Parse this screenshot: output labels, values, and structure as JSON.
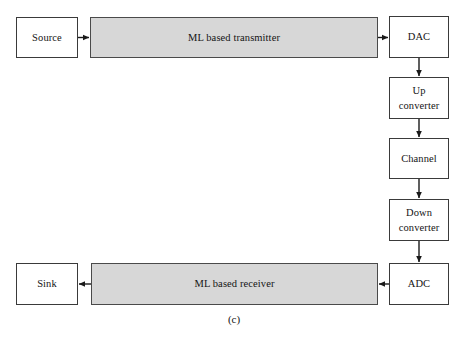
{
  "figure": {
    "caption": "(c)",
    "colors": {
      "shaded_block_fill": "#d7d7d7",
      "block_border": "#3a3a3a",
      "page_background": "#ffffff",
      "connector": "#1a1a1a"
    }
  },
  "nodes": {
    "source": {
      "label": "Source",
      "style": "plain"
    },
    "transmitter": {
      "label": "ML based transmitter",
      "style": "shaded"
    },
    "dac": {
      "label": "DAC",
      "style": "plain"
    },
    "up_converter": {
      "line1": "Up",
      "line2": "converter",
      "style": "plain"
    },
    "channel": {
      "label": "Channel",
      "style": "plain"
    },
    "down_converter": {
      "line1": "Down",
      "line2": "converter",
      "style": "plain"
    },
    "adc": {
      "label": "ADC",
      "style": "plain"
    },
    "receiver": {
      "label": "ML based receiver",
      "style": "shaded"
    },
    "sink": {
      "label": "Sink",
      "style": "plain"
    }
  },
  "connections": [
    {
      "from": "source",
      "to": "transmitter",
      "direction": "right"
    },
    {
      "from": "transmitter",
      "to": "dac",
      "direction": "right"
    },
    {
      "from": "dac",
      "to": "up_converter",
      "direction": "down"
    },
    {
      "from": "up_converter",
      "to": "channel",
      "direction": "down"
    },
    {
      "from": "channel",
      "to": "down_converter",
      "direction": "down"
    },
    {
      "from": "down_converter",
      "to": "adc",
      "direction": "down"
    },
    {
      "from": "adc",
      "to": "receiver",
      "direction": "left"
    },
    {
      "from": "receiver",
      "to": "sink",
      "direction": "left"
    }
  ]
}
